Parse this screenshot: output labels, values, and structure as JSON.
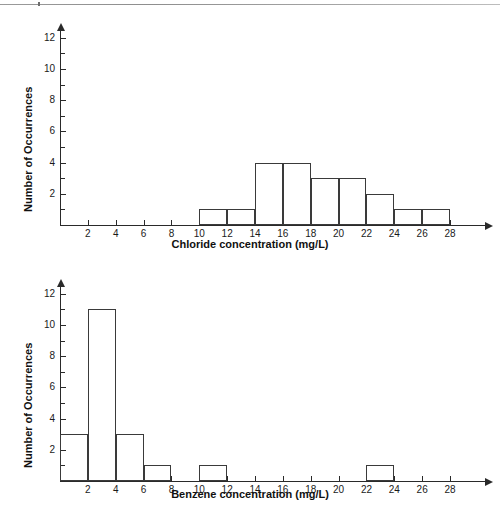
{
  "page": {
    "width": 500,
    "height": 507,
    "background": "#ffffff",
    "ink_color": "#2a2a2a"
  },
  "chart_data": [
    {
      "id": "chloride",
      "type": "bar",
      "subtype": "histogram",
      "title": "",
      "xlabel": "Chloride concentration (mg/L)",
      "ylabel": "Number of Occurrences",
      "xlim": [
        0,
        28
      ],
      "ylim": [
        0,
        13
      ],
      "grid": false,
      "legend": null,
      "x_major_ticks": [
        2,
        4,
        6,
        8,
        10,
        12,
        14,
        16,
        18,
        20,
        22,
        24,
        26,
        28
      ],
      "x_tick_labels": [
        "2",
        "4",
        "6",
        "8",
        "10",
        "12",
        "14",
        "16",
        "18",
        "20",
        "22",
        "24",
        "26",
        "28"
      ],
      "y_major_ticks": [
        2,
        4,
        6,
        8,
        10,
        12
      ],
      "y_tick_labels": [
        "2",
        "4",
        "6",
        "8",
        "10",
        "12"
      ],
      "y_minor_ticks": [
        1,
        3,
        5,
        7,
        9,
        11,
        13
      ],
      "bin_width": 2,
      "bin_edges": [
        0,
        2,
        4,
        6,
        8,
        10,
        12,
        14,
        16,
        18,
        20,
        22,
        24,
        26,
        28
      ],
      "categories": [
        "0-2",
        "2-4",
        "4-6",
        "6-8",
        "8-10",
        "10-12",
        "12-14",
        "14-16",
        "16-18",
        "18-20",
        "20-22",
        "22-24",
        "24-26",
        "26-28"
      ],
      "values": [
        0,
        0,
        0,
        0,
        0,
        1,
        1,
        4,
        4,
        3,
        3,
        2,
        1,
        1
      ]
    },
    {
      "id": "benzene",
      "type": "bar",
      "subtype": "histogram",
      "title": "",
      "xlabel": "Benzene concentration (mg/L)",
      "ylabel": "Number of Occurrences",
      "xlim": [
        0,
        28
      ],
      "ylim": [
        0,
        13
      ],
      "grid": false,
      "legend": null,
      "x_major_ticks": [
        2,
        4,
        6,
        8,
        10,
        12,
        14,
        16,
        18,
        20,
        22,
        24,
        26,
        28
      ],
      "x_tick_labels": [
        "2",
        "4",
        "6",
        "8",
        "10",
        "12",
        "14",
        "16",
        "18",
        "20",
        "22",
        "24",
        "26",
        "28"
      ],
      "y_major_ticks": [
        2,
        4,
        6,
        8,
        10,
        12
      ],
      "y_tick_labels": [
        "2",
        "4",
        "6",
        "8",
        "10",
        "12"
      ],
      "y_minor_ticks": [
        1,
        3,
        5,
        7,
        9,
        11,
        13
      ],
      "bin_width": 2,
      "bin_edges": [
        0,
        2,
        4,
        6,
        8,
        10,
        12,
        14,
        16,
        18,
        20,
        22,
        24,
        26,
        28
      ],
      "categories": [
        "0-2",
        "2-4",
        "4-6",
        "6-8",
        "8-10",
        "10-12",
        "12-14",
        "14-16",
        "16-18",
        "18-20",
        "20-22",
        "22-24",
        "24-26",
        "26-28"
      ],
      "values": [
        3,
        11,
        3,
        1,
        0,
        1,
        0,
        0,
        0,
        0,
        0,
        1,
        0,
        0
      ]
    }
  ]
}
